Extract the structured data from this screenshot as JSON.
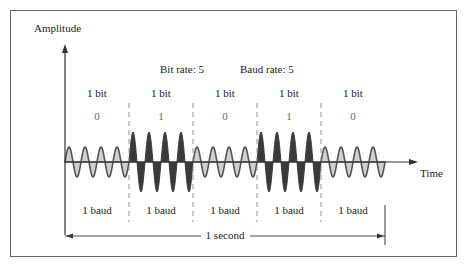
{
  "axes": {
    "y_label": "Amplitude",
    "x_label": "Time"
  },
  "header": {
    "bit_rate": "Bit rate: 5",
    "baud_rate": "Baud rate: 5"
  },
  "bits": [
    {
      "label": "1 bit",
      "value": "0",
      "baud": "1 baud"
    },
    {
      "label": "1 bit",
      "value": "1",
      "baud": "1 baud"
    },
    {
      "label": "1 bit",
      "value": "0",
      "baud": "1 baud"
    },
    {
      "label": "1 bit",
      "value": "1",
      "baud": "1 baud"
    },
    {
      "label": "1 bit",
      "value": "0",
      "baud": "1 baud"
    }
  ],
  "duration_label": "1 second",
  "colors": {
    "low_fill": "#cfcfcf",
    "high_fill": "#3a3a3a",
    "wave_stroke": "#555555",
    "axis": "#333333",
    "divider": "#888888"
  }
}
